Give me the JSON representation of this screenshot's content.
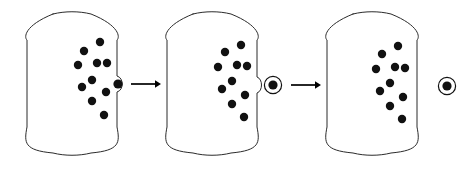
{
  "figure": {
    "background_color": "#ffffff",
    "stroke_color": "#2b2b2b",
    "particle_color": "#111111",
    "arrow_color": "#000000",
    "width": 473,
    "height": 171
  },
  "stages": [
    {
      "name": "stage-1",
      "label": "",
      "container": {
        "x": 27,
        "y": 14,
        "width": 90,
        "height": 139,
        "corner_radius": 26
      },
      "particle_count": 10,
      "particles": [
        {
          "cx": 100,
          "cy": 42,
          "r": 4.2
        },
        {
          "cx": 84,
          "cy": 51,
          "r": 4.2
        },
        {
          "cx": 97,
          "cy": 63,
          "r": 4.2
        },
        {
          "cx": 78,
          "cy": 65,
          "r": 4.2
        },
        {
          "cx": 107,
          "cy": 63,
          "r": 4.2
        },
        {
          "cx": 92,
          "cy": 80,
          "r": 4.2
        },
        {
          "cx": 82,
          "cy": 87,
          "r": 4.2
        },
        {
          "cx": 106,
          "cy": 92,
          "r": 4.2
        },
        {
          "cx": 92,
          "cy": 101,
          "r": 4.2
        },
        {
          "cx": 104,
          "cy": 115,
          "r": 4.2
        }
      ],
      "escaping_particle": {
        "cx": 118,
        "cy": 84,
        "r": 4.6,
        "ringed": false
      },
      "bulge": {
        "cx": 118,
        "cy": 84,
        "rx": 7,
        "ry": 8
      }
    },
    {
      "name": "stage-2",
      "label": "",
      "container": {
        "x": 167,
        "y": 14,
        "width": 90,
        "height": 139,
        "corner_radius": 26
      },
      "particle_count": 10,
      "particles": [
        {
          "cx": 241,
          "cy": 45,
          "r": 4.2
        },
        {
          "cx": 225,
          "cy": 52,
          "r": 4.2
        },
        {
          "cx": 237,
          "cy": 65,
          "r": 4.2
        },
        {
          "cx": 218,
          "cy": 67,
          "r": 4.2
        },
        {
          "cx": 247,
          "cy": 66,
          "r": 4.2
        },
        {
          "cx": 232,
          "cy": 81,
          "r": 4.2
        },
        {
          "cx": 222,
          "cy": 89,
          "r": 4.2
        },
        {
          "cx": 245,
          "cy": 95,
          "r": 4.2
        },
        {
          "cx": 232,
          "cy": 104,
          "r": 4.2
        },
        {
          "cx": 244,
          "cy": 117,
          "r": 4.2
        }
      ],
      "escaping_particle": {
        "cx": 273,
        "cy": 85,
        "r": 4.6,
        "ringed": true,
        "ring_r": 8.6
      },
      "bulge": {
        "cx": 271,
        "cy": 85,
        "rx": 6,
        "ry": 8
      }
    },
    {
      "name": "stage-3",
      "label": "",
      "container": {
        "x": 327,
        "y": 14,
        "width": 90,
        "height": 139,
        "corner_radius": 26
      },
      "particle_count": 10,
      "particles": [
        {
          "cx": 398,
          "cy": 46,
          "r": 4.2
        },
        {
          "cx": 382,
          "cy": 54,
          "r": 4.2
        },
        {
          "cx": 395,
          "cy": 67,
          "r": 4.2
        },
        {
          "cx": 376,
          "cy": 69,
          "r": 4.2
        },
        {
          "cx": 405,
          "cy": 68,
          "r": 4.2
        },
        {
          "cx": 390,
          "cy": 83,
          "r": 4.2
        },
        {
          "cx": 380,
          "cy": 91,
          "r": 4.2
        },
        {
          "cx": 403,
          "cy": 97,
          "r": 4.2
        },
        {
          "cx": 390,
          "cy": 106,
          "r": 4.2
        },
        {
          "cx": 402,
          "cy": 119,
          "r": 4.2
        }
      ],
      "escaping_particle": null,
      "bulge": null
    }
  ],
  "arrows": [
    {
      "name": "arrow-1",
      "x1": 131,
      "y1": 84,
      "x2": 161,
      "y2": 84,
      "head_size": 6
    },
    {
      "name": "arrow-2",
      "x1": 291,
      "y1": 85,
      "x2": 321,
      "y2": 85,
      "head_size": 6
    }
  ],
  "final_particle": {
    "name": "extracted-particle",
    "cx": 447,
    "cy": 86,
    "r": 4.6,
    "ring_r": 8.6,
    "ringed": true
  }
}
